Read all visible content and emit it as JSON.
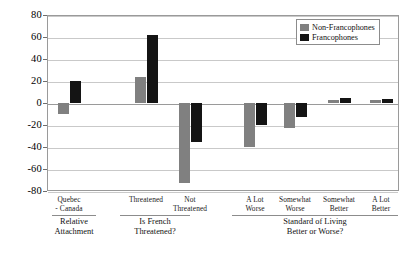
{
  "chart_data": {
    "type": "bar",
    "title": "",
    "subtitle": "",
    "xlabel": "",
    "ylabel": "",
    "ylim": [
      -80,
      80
    ],
    "ytick_step": 20,
    "yticks": [
      80,
      60,
      40,
      20,
      0,
      -20,
      -40,
      -60,
      -80
    ],
    "grid": true,
    "legend_position": "top-right",
    "categories": [
      "Quebec - Canada",
      "Threatened",
      "Not Threatened",
      "A Lot Worse",
      "Somewhat Worse",
      "Somewhat Better",
      "A Lot Better"
    ],
    "series": [
      {
        "name": "Non-Francophones",
        "color": "#808080",
        "values": [
          -10,
          24,
          -73,
          -40,
          -23,
          3,
          3
        ]
      },
      {
        "name": "Francophones",
        "color": "#141414",
        "values": [
          20,
          62,
          -35,
          -20,
          -13,
          5,
          4
        ]
      }
    ],
    "groups": [
      {
        "label": "Relative Attachment",
        "categories": [
          "Quebec - Canada"
        ]
      },
      {
        "label": "Is French Threatened?",
        "categories": [
          "Threatened",
          "Not Threatened"
        ]
      },
      {
        "label": "Standard of Living Better or Worse?",
        "categories": [
          "A Lot Worse",
          "Somewhat Worse",
          "Somewhat Better",
          "A Lot Better"
        ]
      }
    ]
  },
  "axis": {
    "ytick_labels": [
      "80",
      "60",
      "40",
      "20",
      "0",
      "-20",
      "-40",
      "-60",
      "-80"
    ]
  },
  "categories_display": [
    {
      "line1": "Quebec",
      "line2": "- Canada"
    },
    {
      "line1": "Threatened",
      "line2": ""
    },
    {
      "line1": "Not",
      "line2": "Threatened"
    },
    {
      "line1": "A Lot",
      "line2": "Worse"
    },
    {
      "line1": "Somewhat",
      "line2": "Worse"
    },
    {
      "line1": "Somewhat",
      "line2": "Better"
    },
    {
      "line1": "A Lot",
      "line2": "Better"
    }
  ],
  "group_labels": [
    {
      "line1": "Relative",
      "line2": "Attachment"
    },
    {
      "line1": "Is French",
      "line2": "Threatened?"
    },
    {
      "line1": "Standard of Living",
      "line2": "Better or Worse?"
    }
  ],
  "legend": {
    "items": [
      {
        "label": "Non-Francophones",
        "color": "#808080"
      },
      {
        "label": "Francophones",
        "color": "#141414"
      }
    ]
  }
}
